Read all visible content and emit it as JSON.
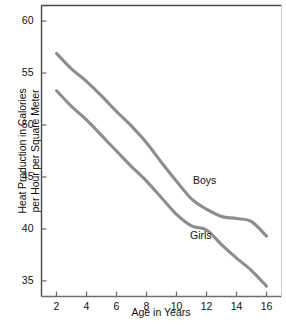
{
  "chart_data": {
    "type": "line",
    "title": "",
    "xlabel": "Age in Years",
    "ylabel": "Heat Production in Calories\nper Hour per Square Meter",
    "xlim": [
      1,
      17
    ],
    "ylim": [
      33.5,
      61.5
    ],
    "xticks": [
      2,
      4,
      6,
      8,
      10,
      12,
      14,
      16
    ],
    "xtick_labels": [
      "2",
      "4",
      "6",
      "8",
      "10",
      "12",
      "14",
      "16"
    ],
    "yticks": [
      35,
      40,
      45,
      50,
      55,
      60
    ],
    "ytick_labels": [
      "35",
      "40",
      "45",
      "50",
      "55",
      "60"
    ],
    "grid": false,
    "legend_position": "inline-annotation",
    "line_color": "#8d8d8d",
    "axis_color": "#6e6e6e",
    "x": [
      2,
      3,
      4,
      5,
      6,
      7,
      8,
      9,
      10,
      11,
      12,
      13,
      14,
      15,
      16
    ],
    "series": [
      {
        "name": "Boys",
        "label": "Boys",
        "label_x": 11.1,
        "label_y": 44.6,
        "values": [
          56.9,
          55.4,
          54.2,
          52.8,
          51.3,
          49.9,
          48.3,
          46.4,
          44.6,
          42.9,
          41.9,
          41.2,
          41.0,
          40.7,
          39.3
        ]
      },
      {
        "name": "Girls",
        "label": "Girls",
        "label_x": 10.9,
        "label_y": 39.3,
        "values": [
          53.3,
          51.8,
          50.5,
          49.0,
          47.5,
          46.0,
          44.6,
          43.0,
          41.4,
          40.3,
          39.9,
          38.5,
          37.2,
          36.0,
          34.5
        ]
      }
    ],
    "annotations": [
      {
        "text": "Boys",
        "x": 11.1,
        "y": 44.6
      },
      {
        "text": "Girls",
        "x": 10.9,
        "y": 39.3
      }
    ]
  }
}
